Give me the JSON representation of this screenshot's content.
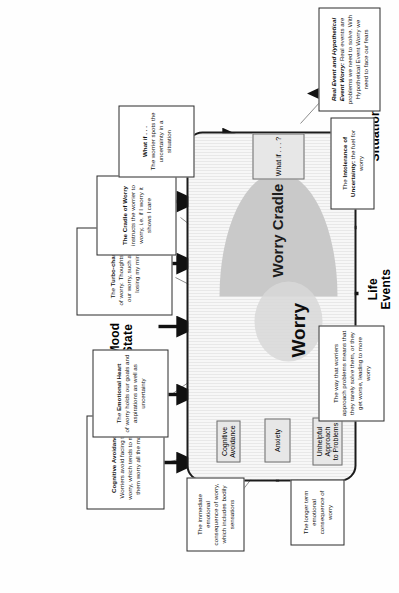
{
  "diagram": {
    "type": "concept-diagram",
    "orientation": "rotated-90"
  },
  "big_labels": {
    "mood_state": "Mood\nState",
    "situation_event": "Situation/Event",
    "life_events": "Life\nEvents"
  },
  "core": {
    "worry": "Worry",
    "worry_cradle": "Worry Cradle",
    "nodes": {
      "cognitive_avoidance": "Cognitive\nAvoidance",
      "anxiety": "Anxiety",
      "unhelpful_approach": "Unhelpful\nApproach\nto Problems",
      "what_if": "What if . . . ?"
    }
  },
  "notes": {
    "cognitive_avoidance": {
      "head": "Cognitive Avoidance",
      "body": "Worriers avoid facing their worry, which tends to make them worry all the more"
    },
    "emotional_heart": {
      "lead": "The ",
      "head": "Emotional Heart",
      "body": "of worry holds our goals and aspirations as well as uncertainty"
    },
    "turbo_charger": {
      "lead": "The ",
      "head": "Turbo-charger",
      "body": "of worry. Thoughts about our worry, such as 'I'm losing my mind'"
    },
    "cradle_of_worry": {
      "head": "The Cradle of Worry",
      "body": "instructs the worrier to worry, i.e. if I worry it shows I care"
    },
    "what_if": {
      "head": "What if . . .",
      "body": "The worrier spots the uncertainty in a situation"
    },
    "immediate_consequence": {
      "body": "The immediate emotional consequence of worry, which includes bodily sensations"
    },
    "longer_term": {
      "body": "The longer term emotional consequence of worry"
    },
    "problem_approach": {
      "body": "The way that worriers approach problems means that they rarely solve them, or they get worse, leading to more worry"
    },
    "intolerance": {
      "lead": "The ",
      "head": "Intolerance of Uncertainty:",
      "body": " the fuel for worry"
    },
    "real_hypothetical": {
      "head": "Real Event and Hypothetical Event Worry:",
      "body": " Real events are problems we need to solve. With Hypothetical Event Worry we need to face our fears"
    }
  },
  "colors": {
    "ink": "#111111",
    "cradle_fill": "#c9c9c9",
    "node_fill": "#e7e7e7",
    "border": "#2b2b2b"
  }
}
